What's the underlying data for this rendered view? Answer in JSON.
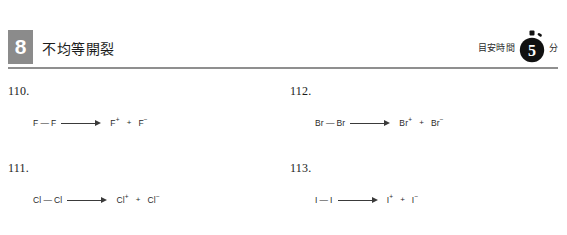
{
  "header": {
    "section_number": "8",
    "section_title": "不均等開裂",
    "time_label": "目安時間",
    "time_value": "5",
    "time_unit": "分",
    "badge_color": "#8b8b8b",
    "rule_color": "#8f8f8f",
    "stopwatch_icon": "stopwatch-icon"
  },
  "problems": [
    {
      "number": "110.",
      "left_atom": "F",
      "bond": "—",
      "right_atom": "F",
      "arrow": "arrow-right-icon",
      "cation": "F",
      "cation_charge": "+",
      "plus": "+",
      "anion": "F",
      "anion_charge": "−"
    },
    {
      "number": "112.",
      "left_atom": "Br",
      "bond": "—",
      "right_atom": "Br",
      "arrow": "arrow-right-icon",
      "cation": "Br",
      "cation_charge": "+",
      "plus": "+",
      "anion": "Br",
      "anion_charge": "−"
    },
    {
      "number": "111.",
      "left_atom": "Cl",
      "bond": "—",
      "right_atom": "Cl",
      "arrow": "arrow-right-icon",
      "cation": "Cl",
      "cation_charge": "+",
      "plus": "+",
      "anion": "Cl",
      "anion_charge": "−"
    },
    {
      "number": "113.",
      "left_atom": "I",
      "bond": "—",
      "right_atom": "I",
      "arrow": "arrow-right-icon",
      "cation": "I",
      "cation_charge": "+",
      "plus": "+",
      "anion": "I",
      "anion_charge": "−"
    }
  ]
}
